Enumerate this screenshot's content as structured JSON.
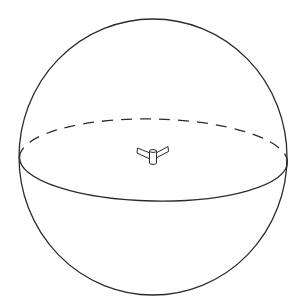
{
  "diagram": {
    "type": "sphere-with-equator",
    "background": "#ffffff",
    "stroke_color": "#2b2b2b",
    "sphere": {
      "cx": 153,
      "cy": 157,
      "rx": 134,
      "ry": 138
    },
    "equator": {
      "cx": 153.5,
      "cy": 160,
      "rx": 134,
      "ry": 41,
      "rotation_deg": 1.1,
      "front": "solid",
      "back": "dashed"
    },
    "center_object": {
      "name": "winged-cylinder",
      "x": 153,
      "y": 156
    }
  }
}
